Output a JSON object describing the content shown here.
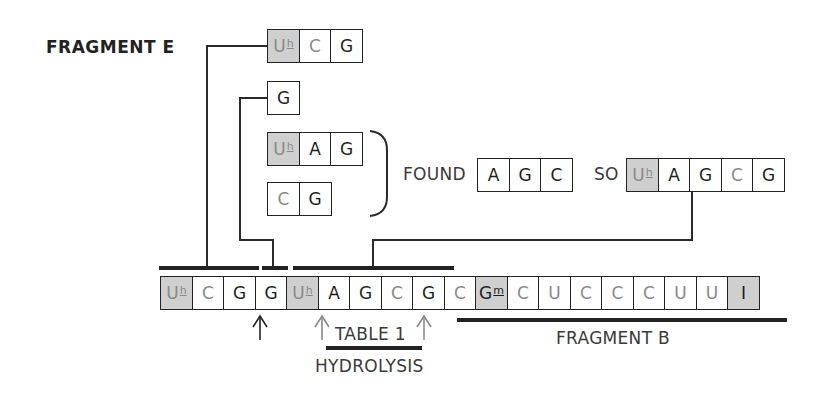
{
  "diagram": {
    "fragment_e": {
      "label": "FRAGMENT E",
      "sequence": [
        {
          "base": "U",
          "mod": "h",
          "shaded": true,
          "light": true
        },
        {
          "base": "C",
          "mod": "",
          "shaded": false,
          "light": true
        },
        {
          "base": "G",
          "mod": "",
          "shaded": false,
          "light": false
        }
      ]
    },
    "g_fragment": {
      "sequence": [
        {
          "base": "G",
          "mod": "",
          "shaded": false,
          "light": false
        }
      ]
    },
    "uhag_fragment": {
      "sequence": [
        {
          "base": "U",
          "mod": "h",
          "shaded": true,
          "light": true
        },
        {
          "base": "A",
          "mod": "",
          "shaded": false,
          "light": false
        },
        {
          "base": "G",
          "mod": "",
          "shaded": false,
          "light": false
        }
      ]
    },
    "cg_fragment": {
      "sequence": [
        {
          "base": "C",
          "mod": "",
          "shaded": false,
          "light": true
        },
        {
          "base": "G",
          "mod": "",
          "shaded": false,
          "light": false
        }
      ]
    },
    "found": {
      "label": "FOUND",
      "sequence": [
        {
          "base": "A",
          "mod": "",
          "shaded": false,
          "light": false
        },
        {
          "base": "G",
          "mod": "",
          "shaded": false,
          "light": false
        },
        {
          "base": "C",
          "mod": "",
          "shaded": false,
          "light": false
        }
      ]
    },
    "so": {
      "label": "SO",
      "sequence": [
        {
          "base": "U",
          "mod": "h",
          "shaded": true,
          "light": true
        },
        {
          "base": "A",
          "mod": "",
          "shaded": false,
          "light": false
        },
        {
          "base": "G",
          "mod": "",
          "shaded": false,
          "light": false
        },
        {
          "base": "C",
          "mod": "",
          "shaded": false,
          "light": true
        },
        {
          "base": "G",
          "mod": "",
          "shaded": false,
          "light": false
        }
      ]
    },
    "main_sequence": [
      {
        "base": "U",
        "mod": "h",
        "shaded": true,
        "light": true
      },
      {
        "base": "C",
        "mod": "",
        "shaded": false,
        "light": true
      },
      {
        "base": "G",
        "mod": "",
        "shaded": false,
        "light": false
      },
      {
        "base": "G",
        "mod": "",
        "shaded": false,
        "light": false
      },
      {
        "base": "U",
        "mod": "h",
        "shaded": true,
        "light": true
      },
      {
        "base": "A",
        "mod": "",
        "shaded": false,
        "light": false
      },
      {
        "base": "G",
        "mod": "",
        "shaded": false,
        "light": false
      },
      {
        "base": "C",
        "mod": "",
        "shaded": false,
        "light": true
      },
      {
        "base": "G",
        "mod": "",
        "shaded": false,
        "light": false
      },
      {
        "base": "C",
        "mod": "",
        "shaded": false,
        "light": true
      },
      {
        "base": "G",
        "mod": "m",
        "shaded": true,
        "light": false
      },
      {
        "base": "C",
        "mod": "",
        "shaded": false,
        "light": true
      },
      {
        "base": "U",
        "mod": "",
        "shaded": false,
        "light": true
      },
      {
        "base": "C",
        "mod": "",
        "shaded": false,
        "light": true
      },
      {
        "base": "C",
        "mod": "",
        "shaded": false,
        "light": true
      },
      {
        "base": "C",
        "mod": "",
        "shaded": false,
        "light": true
      },
      {
        "base": "U",
        "mod": "",
        "shaded": false,
        "light": true
      },
      {
        "base": "U",
        "mod": "",
        "shaded": false,
        "light": true
      },
      {
        "base": "I",
        "mod": "",
        "shaded": true,
        "light": false
      }
    ],
    "annotations": {
      "table_label": "TABLE 1",
      "hydrolysis_label": "HYDROLYSIS",
      "fragment_b_label": "FRAGMENT B"
    },
    "colors": {
      "shaded_cell": "#cfcfcf",
      "light_text": "#8a8a8a",
      "dark_text": "#1d1d1d",
      "line": "#222222"
    }
  }
}
